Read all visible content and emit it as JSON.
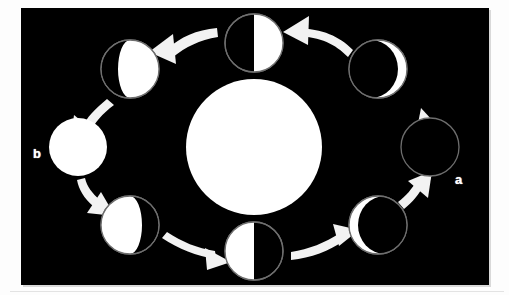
{
  "figure": {
    "kind": "moon-phases-orbit-diagram",
    "background_color": "#000000",
    "page_color": "#fdfdfd",
    "moon_lit_color": "#ffffff",
    "moon_dark_color": "#000000",
    "moon_outline_color": "#7a7a7a",
    "arrow_color": "#f2f2f2",
    "sun_color": "#ffffff"
  },
  "labels": [
    {
      "id": "b",
      "text": "b",
      "x": 12,
      "y": 139
    },
    {
      "id": "a",
      "text": "a",
      "x": 434,
      "y": 165
    }
  ],
  "sun": {
    "name": "sun",
    "cx": 233,
    "cy": 139,
    "r": 68
  },
  "orbit": {
    "cx": 233,
    "cy": 139,
    "rx": 176,
    "ry": 112
  },
  "moons": [
    {
      "id": "moon-a-new",
      "phase": "new",
      "lit_fraction": 0.0,
      "lit_side": "none",
      "angle_deg": 0,
      "cx": 409,
      "cy": 139,
      "r": 29,
      "label": "a"
    },
    {
      "id": "moon-waxing-crescent",
      "phase": "waxing-crescent",
      "lit_fraction": 0.22,
      "lit_side": "right",
      "angle_deg": 45,
      "cx": 357,
      "cy": 61,
      "r": 29,
      "label": ""
    },
    {
      "id": "moon-first-quarter",
      "phase": "first-quarter",
      "lit_fraction": 0.5,
      "lit_side": "right",
      "angle_deg": 90,
      "cx": 233,
      "cy": 35,
      "r": 29,
      "label": ""
    },
    {
      "id": "moon-waxing-gibbous",
      "phase": "waxing-gibbous",
      "lit_fraction": 0.8,
      "lit_side": "right",
      "angle_deg": 135,
      "cx": 109,
      "cy": 61,
      "r": 29,
      "label": ""
    },
    {
      "id": "moon-b-full",
      "phase": "full",
      "lit_fraction": 1.0,
      "lit_side": "all",
      "angle_deg": 180,
      "cx": 57,
      "cy": 139,
      "r": 29,
      "label": "b"
    },
    {
      "id": "moon-waning-gibbous",
      "phase": "waning-gibbous",
      "lit_fraction": 0.8,
      "lit_side": "left",
      "angle_deg": 225,
      "cx": 109,
      "cy": 217,
      "r": 29,
      "label": ""
    },
    {
      "id": "moon-last-quarter",
      "phase": "last-quarter",
      "lit_fraction": 0.5,
      "lit_side": "left",
      "angle_deg": 270,
      "cx": 233,
      "cy": 243,
      "r": 29,
      "label": ""
    },
    {
      "id": "moon-waning-crescent",
      "phase": "waning-crescent",
      "lit_fraction": 0.22,
      "lit_side": "left",
      "angle_deg": 315,
      "cx": 357,
      "cy": 217,
      "r": 29,
      "label": ""
    }
  ],
  "arrows": [
    {
      "id": "arrow-new-to-waxing-crescent",
      "from": "moon-a-new",
      "to": "moon-waxing-crescent",
      "direction": "counterclockwise"
    },
    {
      "id": "arrow-waxing-crescent-to-first-q",
      "from": "moon-waxing-crescent",
      "to": "moon-first-quarter",
      "direction": "counterclockwise"
    },
    {
      "id": "arrow-first-q-to-waxing-gibbous",
      "from": "moon-first-quarter",
      "to": "moon-waxing-gibbous",
      "direction": "counterclockwise"
    },
    {
      "id": "arrow-waxing-gibbous-to-full",
      "from": "moon-waxing-gibbous",
      "to": "moon-b-full",
      "direction": "counterclockwise"
    },
    {
      "id": "arrow-full-to-waning-gibbous",
      "from": "moon-b-full",
      "to": "moon-waning-gibbous",
      "direction": "counterclockwise"
    },
    {
      "id": "arrow-waning-gibbous-to-last-q",
      "from": "moon-waning-gibbous",
      "to": "moon-last-quarter",
      "direction": "counterclockwise"
    },
    {
      "id": "arrow-last-q-to-waning-crescent",
      "from": "moon-last-quarter",
      "to": "moon-waning-crescent",
      "direction": "counterclockwise"
    },
    {
      "id": "arrow-waning-crescent-to-new",
      "from": "moon-waning-crescent",
      "to": "moon-a-new",
      "direction": "counterclockwise"
    }
  ]
}
